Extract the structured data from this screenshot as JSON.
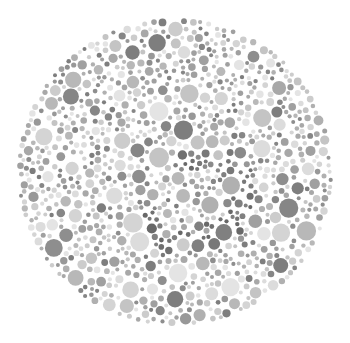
{
  "image": {
    "description": "Grayscale Ishihara-style color vision test plate made of circular dots",
    "background": "#ffffff",
    "plate": {
      "cx": 175,
      "cy": 172,
      "rx": 158,
      "ry": 154
    },
    "dot_palette": {
      "light": [
        "#e4e4e4",
        "#dcdcdc",
        "#d4d4d4",
        "#cccccc",
        "#c4c4c4"
      ],
      "mid": [
        "#b8b8b8",
        "#b0b0b0",
        "#a8a8a8",
        "#a0a0a0"
      ],
      "dark": [
        "#989898",
        "#8e8e8e",
        "#868686",
        "#7e7e7e"
      ],
      "figure": [
        "#8a8a8a",
        "#808080",
        "#787878",
        "#707070",
        "#686868"
      ]
    },
    "dot_radius_range": [
      2,
      10
    ],
    "dot_count": 1400,
    "seed": 7,
    "figure": {
      "label": "hidden digit region",
      "path": [
        [
          185,
          165
        ],
        [
          205,
          155
        ],
        [
          225,
          158
        ],
        [
          240,
          170
        ],
        [
          245,
          190
        ],
        [
          240,
          210
        ],
        [
          228,
          225
        ],
        [
          210,
          235
        ],
        [
          190,
          242
        ],
        [
          170,
          245
        ],
        [
          155,
          240
        ],
        [
          150,
          225
        ]
      ],
      "stroke_radius": 14
    }
  }
}
